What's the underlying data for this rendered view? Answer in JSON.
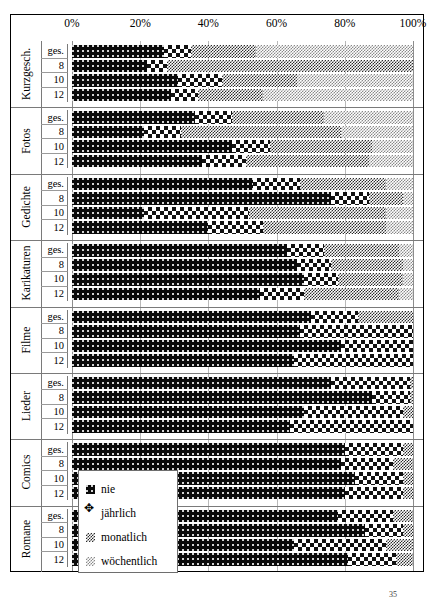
{
  "chart_data": {
    "type": "bar",
    "orientation": "horizontal",
    "stacked": true,
    "stack_mode": "percent",
    "title": "",
    "xlabel": "",
    "ylabel": "",
    "xlim": [
      0,
      100
    ],
    "xticks": [
      0,
      20,
      40,
      60,
      80,
      100
    ],
    "xtick_labels": [
      "0%",
      "20%",
      "40%",
      "60%",
      "80%",
      "100%"
    ],
    "grid": true,
    "legend_position": "inside-lower-left",
    "series": [
      {
        "name": "nie",
        "key": "nie",
        "fill": "black-dotted",
        "color": "#0a0a0a"
      },
      {
        "name": "jährlich",
        "key": "jaehrlich",
        "fill": "large-checker",
        "color": "#111111"
      },
      {
        "name": "monatlich",
        "key": "monatlich",
        "fill": "fine-checker",
        "color": "#2b2b2b"
      },
      {
        "name": "wöchentlich",
        "key": "woechentlich",
        "fill": "light-checker",
        "color": "#8a8a8a"
      }
    ],
    "groups": [
      {
        "category": "Kurzgesch.",
        "rows": [
          {
            "label": "ges.",
            "values": [
              27,
              8,
              19,
              46
            ]
          },
          {
            "label": "8",
            "values": [
              22,
              6,
              72,
              0
            ]
          },
          {
            "label": "10",
            "values": [
              31,
              13,
              22,
              34
            ]
          },
          {
            "label": "12",
            "values": [
              29,
              8,
              19,
              44
            ]
          }
        ]
      },
      {
        "category": "Fotos",
        "rows": [
          {
            "label": "ges.",
            "values": [
              36,
              11,
              27,
              26
            ]
          },
          {
            "label": "8",
            "values": [
              21,
              11,
              47,
              21
            ]
          },
          {
            "label": "10",
            "values": [
              47,
              11,
              30,
              12
            ]
          },
          {
            "label": "12",
            "values": [
              38,
              13,
              36,
              13
            ]
          }
        ]
      },
      {
        "category": "Gedichte",
        "rows": [
          {
            "label": "ges.",
            "values": [
              53,
              14,
              25,
              8
            ]
          },
          {
            "label": "8",
            "values": [
              76,
              11,
              10,
              3
            ]
          },
          {
            "label": "10",
            "values": [
              21,
              31,
              40,
              8
            ]
          },
          {
            "label": "12",
            "values": [
              40,
              16,
              36,
              8
            ]
          }
        ]
      },
      {
        "category": "Karikaturen",
        "rows": [
          {
            "label": "ges.",
            "values": [
              63,
              11,
              22,
              4
            ]
          },
          {
            "label": "8",
            "values": [
              66,
              10,
              21,
              3
            ]
          },
          {
            "label": "10",
            "values": [
              68,
              10,
              19,
              3
            ]
          },
          {
            "label": "12",
            "values": [
              55,
              13,
              28,
              4
            ]
          }
        ]
      },
      {
        "category": "Filme",
        "rows": [
          {
            "label": "ges.",
            "values": [
              70,
              14,
              16,
              0
            ]
          },
          {
            "label": "8",
            "values": [
              67,
              33,
              0,
              0
            ]
          },
          {
            "label": "10",
            "values": [
              79,
              21,
              0,
              0
            ]
          },
          {
            "label": "12",
            "values": [
              65,
              35,
              0,
              0
            ]
          }
        ]
      },
      {
        "category": "Lieder",
        "rows": [
          {
            "label": "ges.",
            "values": [
              76,
              23,
              1,
              0
            ]
          },
          {
            "label": "8",
            "values": [
              88,
              11,
              1,
              0
            ]
          },
          {
            "label": "10",
            "values": [
              68,
              29,
              3,
              0
            ]
          },
          {
            "label": "12",
            "values": [
              64,
              36,
              0,
              0
            ]
          }
        ]
      },
      {
        "category": "Comics",
        "rows": [
          {
            "label": "ges.",
            "values": [
              80,
              17,
              3,
              0
            ]
          },
          {
            "label": "8",
            "values": [
              79,
              15,
              6,
              0
            ]
          },
          {
            "label": "10",
            "values": [
              83,
              14,
              3,
              0
            ]
          },
          {
            "label": "12",
            "values": [
              80,
              17,
              3,
              0
            ]
          }
        ]
      },
      {
        "category": "Romane",
        "rows": [
          {
            "label": "ges.",
            "values": [
              78,
              16,
              6,
              0
            ]
          },
          {
            "label": "8",
            "values": [
              86,
              11,
              3,
              0
            ]
          },
          {
            "label": "10",
            "values": [
              65,
              27,
              8,
              0
            ]
          },
          {
            "label": "12",
            "values": [
              81,
              14,
              5,
              0
            ]
          }
        ]
      }
    ]
  },
  "axis": {
    "ticks": [
      "0%",
      "20%",
      "40%",
      "60%",
      "80%",
      "100%"
    ]
  },
  "legend": {
    "items": [
      {
        "label": "nie",
        "swatch": "s-nie"
      },
      {
        "label": "jährlich",
        "swatch": "s-jaehrlich"
      },
      {
        "label": "monatlich",
        "swatch": "s-monatlich"
      },
      {
        "label": "wöchentlich",
        "swatch": "s-woechentlich"
      }
    ]
  },
  "footnote": {
    "marker": "35"
  }
}
